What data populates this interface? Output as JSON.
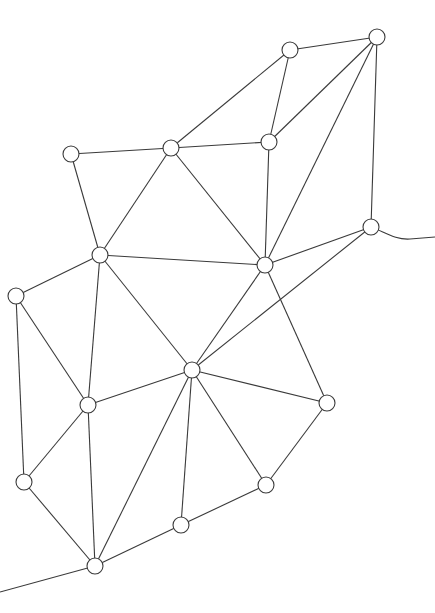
{
  "diagram": {
    "type": "network-graph",
    "width": 435,
    "height": 613,
    "node_radius": 8,
    "colors": {
      "stroke": "#3a3a3a",
      "node_fill": "#ffffff",
      "background": "#ffffff"
    },
    "nodes": [
      {
        "id": "A",
        "x": 290,
        "y": 50
      },
      {
        "id": "B",
        "x": 377,
        "y": 37
      },
      {
        "id": "C",
        "x": 171,
        "y": 148
      },
      {
        "id": "D",
        "x": 269,
        "y": 142
      },
      {
        "id": "E",
        "x": 71,
        "y": 154
      },
      {
        "id": "F",
        "x": 100,
        "y": 255
      },
      {
        "id": "G",
        "x": 265,
        "y": 265
      },
      {
        "id": "H",
        "x": 371,
        "y": 227
      },
      {
        "id": "I",
        "x": 16,
        "y": 296
      },
      {
        "id": "J",
        "x": 192,
        "y": 370
      },
      {
        "id": "K",
        "x": 88,
        "y": 405
      },
      {
        "id": "L",
        "x": 327,
        "y": 403
      },
      {
        "id": "M",
        "x": 24,
        "y": 482
      },
      {
        "id": "N",
        "x": 266,
        "y": 485
      },
      {
        "id": "O",
        "x": 181,
        "y": 525
      },
      {
        "id": "P",
        "x": 95,
        "y": 566
      }
    ],
    "edges": [
      [
        "A",
        "B"
      ],
      [
        "C",
        "A"
      ],
      [
        "A",
        "D"
      ],
      [
        "D",
        "B"
      ],
      [
        "B",
        "G"
      ],
      [
        "B",
        "H"
      ],
      [
        "E",
        "C"
      ],
      [
        "C",
        "D"
      ],
      [
        "E",
        "F"
      ],
      [
        "C",
        "F"
      ],
      [
        "C",
        "G"
      ],
      [
        "D",
        "G"
      ],
      [
        "F",
        "G"
      ],
      [
        "F",
        "I"
      ],
      [
        "F",
        "K"
      ],
      [
        "F",
        "J"
      ],
      [
        "G",
        "J"
      ],
      [
        "G",
        "L"
      ],
      [
        "H",
        "G"
      ],
      [
        "H",
        "J"
      ],
      [
        "I",
        "K"
      ],
      [
        "I",
        "M"
      ],
      [
        "J",
        "K"
      ],
      [
        "J",
        "L"
      ],
      [
        "J",
        "N"
      ],
      [
        "J",
        "O"
      ],
      [
        "J",
        "P"
      ],
      [
        "K",
        "M"
      ],
      [
        "K",
        "P"
      ],
      [
        "L",
        "N"
      ],
      [
        "M",
        "P"
      ],
      [
        "N",
        "O"
      ],
      [
        "O",
        "P"
      ]
    ],
    "tails": [
      {
        "from": "H",
        "path": "M 371 227 C 385 232, 395 240, 410 239 L 435 237"
      },
      {
        "from": "P",
        "path": "M 95 566 L 0 592"
      }
    ]
  }
}
